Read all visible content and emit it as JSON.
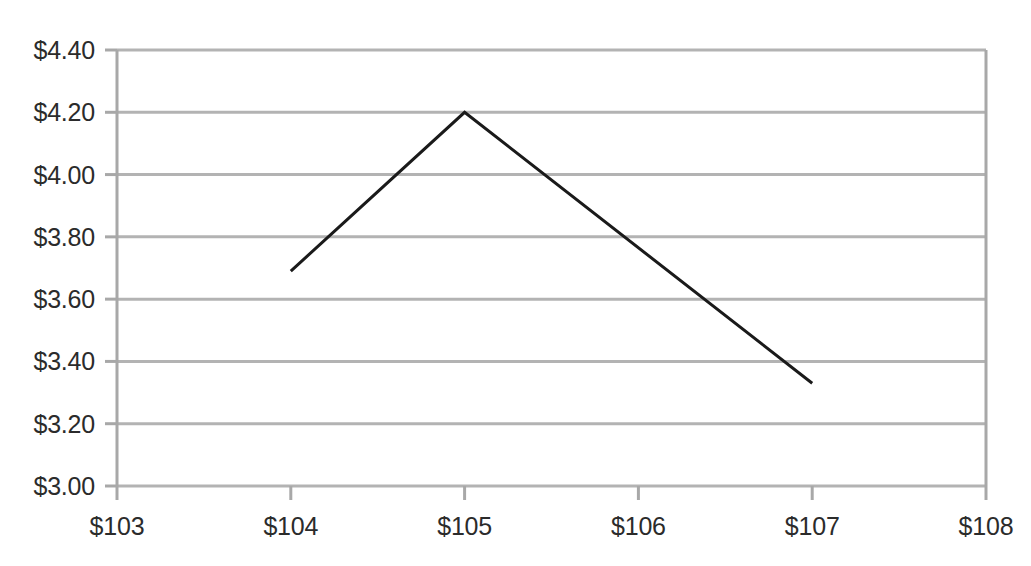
{
  "chart_data": {
    "type": "line",
    "title": "",
    "xlabel": "",
    "ylabel": "",
    "xlim": [
      103,
      108
    ],
    "ylim": [
      3.0,
      4.4
    ],
    "grid": true,
    "legend": false,
    "x_tick_labels": [
      "$103",
      "$104",
      "$105",
      "$106",
      "$107",
      "$108"
    ],
    "x_ticks": [
      103,
      104,
      105,
      106,
      107,
      108
    ],
    "y_tick_labels": [
      "$4.40",
      "$4.20",
      "$4.00",
      "$3.80",
      "$3.60",
      "$3.40",
      "$3.20",
      "$3.00"
    ],
    "y_ticks": [
      4.4,
      4.2,
      4.0,
      3.8,
      3.6,
      3.4,
      3.2,
      3.0
    ],
    "series": [
      {
        "name": "payoff",
        "color": "#1a1a1a",
        "line_width": 3,
        "x": [
          104,
          105,
          107
        ],
        "y": [
          3.69,
          4.2,
          3.33
        ]
      }
    ],
    "colors": {
      "gridline": "#b3b3b3",
      "axis": "#a8a8a8",
      "tick_text": "#2b2b2b",
      "background": "#ffffff",
      "series_line": "#1a1a1a"
    },
    "geometry": {
      "plot_left": 117,
      "plot_right": 986,
      "plot_top": 50,
      "plot_bottom": 486
    }
  }
}
